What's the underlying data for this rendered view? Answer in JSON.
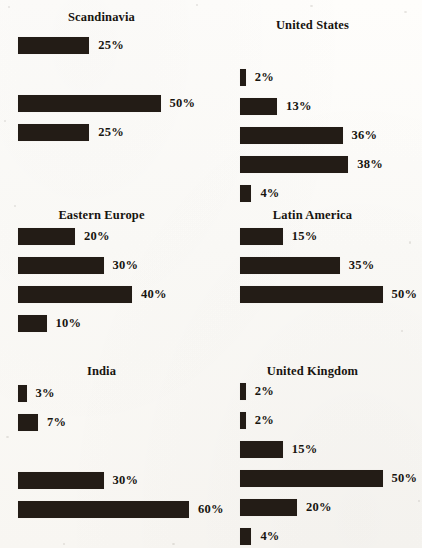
{
  "figure": {
    "type": "small-multiples-bar-grid",
    "orientation": "horizontal",
    "value_suffix": "%",
    "bar_color": "#231c16",
    "background_color": "#fdfcfa",
    "columns": 2,
    "rows": 3
  },
  "panels": [
    {
      "id": "scandinavia",
      "title": "Scandinavia",
      "bars": [
        {
          "value": 25,
          "label": "25%",
          "visible": true
        },
        {
          "value": 0,
          "label": "",
          "visible": false
        },
        {
          "value": 50,
          "label": "50%",
          "visible": true
        },
        {
          "value": 25,
          "label": "25%",
          "visible": true
        }
      ]
    },
    {
      "id": "united-states",
      "title": "United States",
      "bars": [
        {
          "value": 2,
          "label": "2%",
          "visible": true
        },
        {
          "value": 13,
          "label": "13%",
          "visible": true
        },
        {
          "value": 36,
          "label": "36%",
          "visible": true
        },
        {
          "value": 38,
          "label": "38%",
          "visible": true
        },
        {
          "value": 4,
          "label": "4%",
          "visible": true
        }
      ]
    },
    {
      "id": "eastern-europe",
      "title": "Eastern Europe",
      "bars": [
        {
          "value": 20,
          "label": "20%",
          "visible": true
        },
        {
          "value": 30,
          "label": "30%",
          "visible": true
        },
        {
          "value": 40,
          "label": "40%",
          "visible": true
        },
        {
          "value": 10,
          "label": "10%",
          "visible": true
        }
      ]
    },
    {
      "id": "latin-america",
      "title": "Latin America",
      "bars": [
        {
          "value": 15,
          "label": "15%",
          "visible": true
        },
        {
          "value": 35,
          "label": "35%",
          "visible": true
        },
        {
          "value": 50,
          "label": "50%",
          "visible": true
        }
      ]
    },
    {
      "id": "india",
      "title": "India",
      "bars": [
        {
          "value": 3,
          "label": "3%",
          "visible": true
        },
        {
          "value": 7,
          "label": "7%",
          "visible": true
        },
        {
          "value": 0,
          "label": "",
          "visible": false
        },
        {
          "value": 30,
          "label": "30%",
          "visible": true
        },
        {
          "value": 60,
          "label": "60%",
          "visible": true
        }
      ]
    },
    {
      "id": "united-kingdom",
      "title": "United Kingdom",
      "bars": [
        {
          "value": 2,
          "label": "2%",
          "visible": true
        },
        {
          "value": 2,
          "label": "2%",
          "visible": true
        },
        {
          "value": 15,
          "label": "15%",
          "visible": true
        },
        {
          "value": 50,
          "label": "50%",
          "visible": true
        },
        {
          "value": 20,
          "label": "20%",
          "visible": true
        },
        {
          "value": 4,
          "label": "4%",
          "visible": true
        }
      ]
    }
  ],
  "chart_data": {
    "type": "bar",
    "title": "",
    "xlabel": "",
    "ylabel": "",
    "xlim": [
      0,
      60
    ],
    "grid": false,
    "legend": "none",
    "orientation": "horizontal",
    "unit": "percent",
    "panels": [
      {
        "name": "Scandinavia",
        "values": [
          25,
          0,
          50,
          25
        ]
      },
      {
        "name": "United States",
        "values": [
          2,
          13,
          36,
          38,
          4
        ]
      },
      {
        "name": "Eastern Europe",
        "values": [
          20,
          30,
          40,
          10
        ]
      },
      {
        "name": "Latin America",
        "values": [
          15,
          35,
          50
        ]
      },
      {
        "name": "India",
        "values": [
          3,
          7,
          0,
          30,
          60
        ]
      },
      {
        "name": "United Kingdom",
        "values": [
          2,
          2,
          15,
          50,
          20,
          4
        ]
      }
    ]
  },
  "layout": {
    "px_per_percent": 2.85,
    "bar_height_px": 17,
    "panel_geometry": [
      {
        "title_top": 10,
        "bars_top": 37,
        "origin": "left"
      },
      {
        "title_top": 18,
        "bars_top": 69,
        "origin": "right"
      },
      {
        "title_top": 8,
        "bars_top": 28,
        "origin": "left"
      },
      {
        "title_top": 8,
        "bars_top": 28,
        "origin": "right"
      },
      {
        "title_top": 14,
        "bars_top": 35,
        "origin": "left"
      },
      {
        "title_top": 14,
        "bars_top": 33,
        "origin": "right"
      }
    ]
  }
}
